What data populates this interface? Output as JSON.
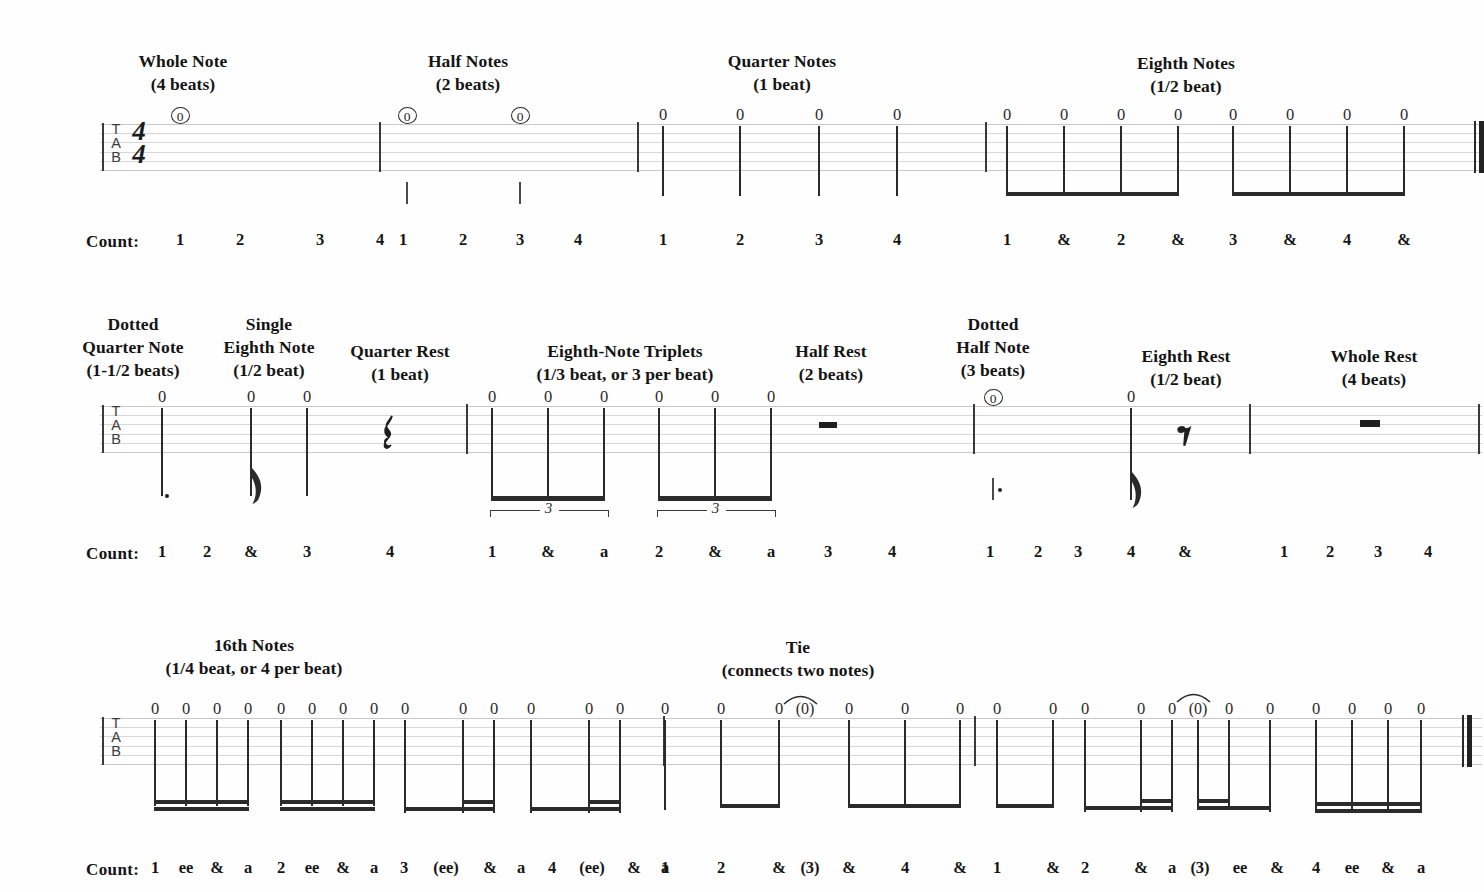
{
  "document": {
    "kind": "guitar-tablature-rhythm-reference",
    "staff_label": "TAB",
    "time_signature": {
      "top": "4",
      "bottom": "4"
    },
    "count_label": "Count:",
    "fret_value": "0",
    "tied_fret_value": "(0)",
    "triplet_number": "3",
    "colors": {
      "ink": "#1a1a1a",
      "staff_line": "#c9c9c9",
      "paper": "#fefefe"
    }
  },
  "rows": [
    {
      "id": "row-1",
      "labels": [
        {
          "id": "whole-note",
          "title": "Whole Note",
          "subtitle": "(4 beats)"
        },
        {
          "id": "half-notes",
          "title": "Half Notes",
          "subtitle": "(2 beats)"
        },
        {
          "id": "quarter-notes",
          "title": "Quarter Notes",
          "subtitle": "(1 beat)"
        },
        {
          "id": "eighth-notes",
          "title": "Eighth Notes",
          "subtitle": "(1/2 beat)"
        }
      ],
      "counts": [
        "1",
        "2",
        "3",
        "4",
        "1",
        "2",
        "3",
        "4",
        "1",
        "2",
        "3",
        "4",
        "1",
        "&",
        "2",
        "&",
        "3",
        "&",
        "4",
        "&"
      ]
    },
    {
      "id": "row-2",
      "labels": [
        {
          "id": "dotted-quarter-note",
          "title": "Dotted\nQuarter Note",
          "subtitle": "(1-1/2 beats)"
        },
        {
          "id": "single-eighth-note",
          "title": "Single\nEighth Note",
          "subtitle": "(1/2 beat)"
        },
        {
          "id": "quarter-rest",
          "title": "Quarter Rest",
          "subtitle": "(1 beat)"
        },
        {
          "id": "eighth-note-triplets",
          "title": "Eighth-Note Triplets",
          "subtitle": "(1/3 beat, or 3 per beat)"
        },
        {
          "id": "half-rest",
          "title": "Half Rest",
          "subtitle": "(2 beats)"
        },
        {
          "id": "dotted-half-note",
          "title": "Dotted\nHalf Note",
          "subtitle": "(3 beats)"
        },
        {
          "id": "eighth-rest",
          "title": "Eighth Rest",
          "subtitle": "(1/2 beat)"
        },
        {
          "id": "whole-rest",
          "title": "Whole Rest",
          "subtitle": "(4 beats)"
        }
      ],
      "counts": [
        "1",
        "2",
        "&",
        "3",
        "4",
        "1",
        "&",
        "a",
        "2",
        "&",
        "a",
        "3",
        "4",
        "1",
        "2",
        "3",
        "4",
        "&",
        "1",
        "2",
        "3",
        "4"
      ]
    },
    {
      "id": "row-3",
      "labels": [
        {
          "id": "sixteenth-notes",
          "title": "16th Notes",
          "subtitle": "(1/4 beat, or 4 per beat)"
        },
        {
          "id": "tie",
          "title": "Tie",
          "subtitle": "(connects two notes)"
        }
      ],
      "counts": [
        "1",
        "ee",
        "&",
        "a",
        "2",
        "ee",
        "&",
        "a",
        "3",
        "(ee)",
        "&",
        "a",
        "4",
        "(ee)",
        "&",
        "a",
        "1",
        "2",
        "&",
        "(3)",
        "&",
        "4",
        "&",
        "1",
        "&",
        "2",
        "&",
        "a",
        "(3)",
        "ee",
        "&",
        "4",
        "ee",
        "&",
        "a"
      ]
    }
  ],
  "glyph_names": {
    "circled_zero": "whole-note-fret-marker",
    "quarter_rest": "quarter-rest-glyph",
    "eighth_rest": "eighth-rest-glyph",
    "half_rest": "half-rest-glyph",
    "whole_rest": "whole-rest-glyph",
    "tie_arc": "tie-arc",
    "beam": "beam",
    "flag": "eighth-flag",
    "dot": "augmentation-dot"
  }
}
